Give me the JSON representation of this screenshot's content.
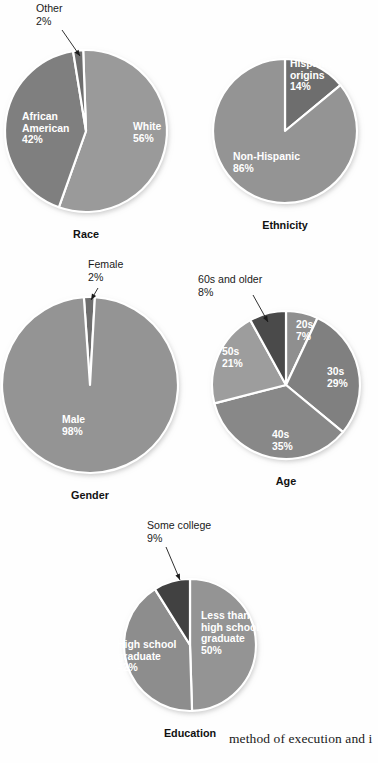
{
  "page": {
    "background_color": "#fefefe",
    "footer_text": "method of execution and i"
  },
  "palette": {
    "light_gray": "#9a9a9a",
    "mid_gray": "#868686",
    "dark_gray": "#6e6e6e",
    "darkest_gray": "#4a4a4a",
    "slice_divider": "#ffffff",
    "label_text": "#ffffff",
    "callout_text": "#1a1a1a",
    "title_text": "#111111"
  },
  "charts": [
    {
      "id": "race",
      "title": "Race",
      "cx": 86,
      "cy": 131,
      "r": 81,
      "start_angle": -2,
      "slices": [
        {
          "label": "White",
          "percent_label": "56%",
          "value": 56,
          "color": "#9a9a9a",
          "label_pos": "inside",
          "lx": 133,
          "ly": 130
        },
        {
          "label": "African\nAmerican",
          "percent_label": "42%",
          "value": 42,
          "color": "#7f7f7f",
          "label_pos": "inside",
          "lx": 22,
          "ly": 120
        },
        {
          "label": "Other",
          "percent_label": "2%",
          "value": 2,
          "color": "#6e6e6e",
          "label_pos": "callout",
          "lx": 36,
          "ly": 12,
          "leader": [
            [
              62,
              30
            ],
            [
              80,
              56
            ]
          ]
        }
      ]
    },
    {
      "id": "ethnicity",
      "title": "Ethnicity",
      "cx": 285,
      "cy": 131,
      "r": 72,
      "start_angle": 0,
      "slices": [
        {
          "label": "Hispanic\norigins",
          "percent_label": "14%",
          "value": 14,
          "color": "#6e6e6e",
          "label_pos": "inside",
          "lx": 290,
          "ly": 67
        },
        {
          "label": "Non-Hispanic",
          "percent_label": "86%",
          "value": 86,
          "color": "#949494",
          "label_pos": "inside",
          "lx": 233,
          "ly": 160
        }
      ]
    },
    {
      "id": "gender",
      "title": "Gender",
      "cx": 90,
      "cy": 385,
      "r": 88,
      "start_angle": -4,
      "slices": [
        {
          "label": "Female",
          "percent_label": "2%",
          "value": 2,
          "color": "#6e6e6e",
          "label_pos": "callout",
          "lx": 88,
          "ly": 268,
          "leader": [
            [
              98,
              288
            ],
            [
              91,
              300
            ]
          ]
        },
        {
          "label": "Male",
          "percent_label": "98%",
          "value": 98,
          "color": "#949494",
          "label_pos": "inside",
          "lx": 62,
          "ly": 423
        }
      ]
    },
    {
      "id": "age",
      "title": "Age",
      "cx": 286,
      "cy": 385,
      "r": 74,
      "start_angle": 0,
      "slices": [
        {
          "label": "20s",
          "percent_label": "7%",
          "value": 7,
          "color": "#8f8f8f",
          "label_pos": "inside",
          "lx": 296,
          "ly": 328
        },
        {
          "label": "30s",
          "percent_label": "29%",
          "value": 29,
          "color": "#808080",
          "label_pos": "inside",
          "lx": 327,
          "ly": 375
        },
        {
          "label": "40s",
          "percent_label": "35%",
          "value": 35,
          "color": "#888888",
          "label_pos": "inside",
          "lx": 272,
          "ly": 438
        },
        {
          "label": "50s",
          "percent_label": "21%",
          "value": 21,
          "color": "#9d9d9d",
          "label_pos": "inside",
          "lx": 222,
          "ly": 355
        },
        {
          "label": "60s and older",
          "percent_label": "8%",
          "value": 8,
          "color": "#4a4a4a",
          "label_pos": "callout",
          "lx": 198,
          "ly": 283,
          "leader": [
            [
              253,
              295
            ],
            [
              268,
              322
            ]
          ]
        }
      ]
    },
    {
      "id": "education",
      "title": "Education",
      "cx": 190,
      "cy": 645,
      "r": 66,
      "start_angle": 0,
      "slices": [
        {
          "label": "Less than\nhigh school\ngraduate",
          "percent_label": "50%",
          "value": 50,
          "color": "#949494",
          "label_pos": "inside",
          "lx": 201,
          "ly": 619
        },
        {
          "label": "High school\ngraduate",
          "percent_label": "42%",
          "value": 42,
          "color": "#8d8d8d",
          "label_pos": "inside",
          "lx": 117,
          "ly": 648
        },
        {
          "label": "Some college",
          "percent_label": "9%",
          "value": 9,
          "color": "#414141",
          "label_pos": "callout",
          "lx": 147,
          "ly": 529,
          "leader": [
            [
              166,
              547
            ],
            [
              180,
              580
            ]
          ]
        }
      ]
    }
  ]
}
